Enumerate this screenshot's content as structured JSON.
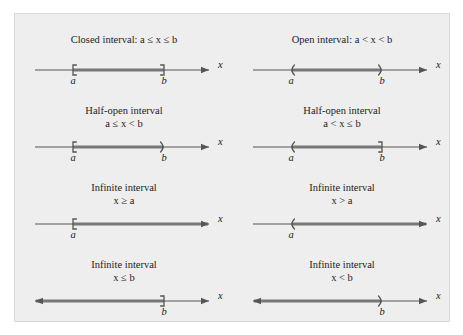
{
  "figure": {
    "background_color": "#eeeeee",
    "border_color": "#d8d8d8",
    "line_color": "#555555",
    "highlight_color": "#777777",
    "text_color": "#1c1c1c",
    "axis_label": "x",
    "label_a": "a",
    "label_b": "b"
  },
  "intervals": [
    {
      "id": "closed-interval",
      "caption_line1": "Closed interval: a ≤ x ≤ b",
      "caption_line2": "",
      "single_line": true,
      "left_marker": "[",
      "right_marker": "]",
      "left_label": "a",
      "right_label": "b",
      "segment": "bounded",
      "left_arrow": false,
      "right_arrow": true
    },
    {
      "id": "open-interval",
      "caption_line1": "Open interval: a < x < b",
      "caption_line2": "",
      "single_line": true,
      "left_marker": "(",
      "right_marker": ")",
      "left_label": "a",
      "right_label": "b",
      "segment": "bounded",
      "left_arrow": false,
      "right_arrow": true
    },
    {
      "id": "half-open-interval-left-closed",
      "caption_line1": "Half-open interval",
      "caption_line2": "a ≤ x < b",
      "single_line": false,
      "left_marker": "[",
      "right_marker": ")",
      "left_label": "a",
      "right_label": "b",
      "segment": "bounded",
      "left_arrow": false,
      "right_arrow": true
    },
    {
      "id": "half-open-interval-right-closed",
      "caption_line1": "Half-open interval",
      "caption_line2": "a < x ≤ b",
      "single_line": false,
      "left_marker": "(",
      "right_marker": "]",
      "left_label": "a",
      "right_label": "b",
      "segment": "bounded",
      "left_arrow": false,
      "right_arrow": true
    },
    {
      "id": "infinite-interval-x-ge-a",
      "caption_line1": "Infinite interval",
      "caption_line2": "x ≥ a",
      "single_line": false,
      "left_marker": "[",
      "right_marker": "",
      "left_label": "a",
      "right_label": "",
      "segment": "right-unbounded",
      "left_arrow": false,
      "right_arrow": true
    },
    {
      "id": "infinite-interval-x-gt-a",
      "caption_line1": "Infinite interval",
      "caption_line2": "x > a",
      "single_line": false,
      "left_marker": "(",
      "right_marker": "",
      "left_label": "a",
      "right_label": "",
      "segment": "right-unbounded",
      "left_arrow": false,
      "right_arrow": true
    },
    {
      "id": "infinite-interval-x-le-b",
      "caption_line1": "Infinite interval",
      "caption_line2": "x ≤ b",
      "single_line": false,
      "left_marker": "",
      "right_marker": "]",
      "left_label": "",
      "right_label": "b",
      "segment": "left-unbounded",
      "left_arrow": true,
      "right_arrow": true
    },
    {
      "id": "infinite-interval-x-lt-b",
      "caption_line1": "Infinite interval",
      "caption_line2": "x < b",
      "single_line": false,
      "left_marker": "",
      "right_marker": ")",
      "left_label": "",
      "right_label": "b",
      "segment": "left-unbounded",
      "left_arrow": true,
      "right_arrow": true
    }
  ]
}
